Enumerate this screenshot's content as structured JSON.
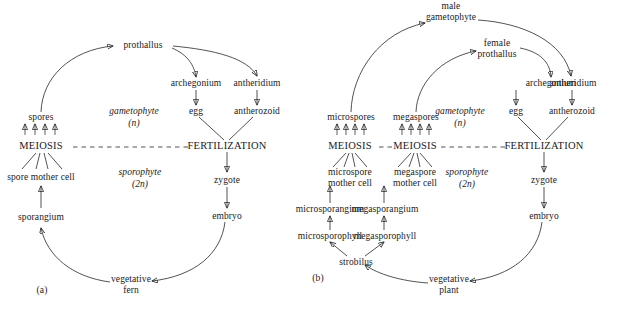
{
  "figure": {
    "type": "diagram",
    "panels": [
      {
        "id": "a",
        "caption": "(a)",
        "organism": "fern",
        "phase_labels": [
          {
            "name": "gametophyte-phase-label",
            "text": "gametophyte",
            "ploidy": "(n)"
          },
          {
            "name": "sporophyte-phase-label",
            "text": "sporophyte",
            "ploidy": "(2n)"
          }
        ],
        "process_labels": [
          "MEIOSIS",
          "FERTILIZATION"
        ],
        "nodes": [
          {
            "id": "a-prothallus",
            "text": "prothallus"
          },
          {
            "id": "a-archegonium",
            "text": "archegonium"
          },
          {
            "id": "a-antheridium",
            "text": "antheridium"
          },
          {
            "id": "a-egg",
            "text": "egg"
          },
          {
            "id": "a-antherozoid",
            "text": "antherozoid"
          },
          {
            "id": "a-spores",
            "text": "spores"
          },
          {
            "id": "a-meiosis",
            "text": "MEIOSIS"
          },
          {
            "id": "a-fertilization",
            "text": "FERTILIZATION"
          },
          {
            "id": "a-spore-mother-cell",
            "text": "spore mother cell"
          },
          {
            "id": "a-zygote",
            "text": "zygote"
          },
          {
            "id": "a-sporangium",
            "text": "sporangium"
          },
          {
            "id": "a-embryo",
            "text": "embryo"
          },
          {
            "id": "a-vegetative-fern",
            "text": "vegetative\nfern"
          }
        ]
      },
      {
        "id": "b",
        "caption": "(b)",
        "organism": "heterosporous plant",
        "phase_labels": [
          {
            "name": "gametophyte-phase-label",
            "text": "gametophyte",
            "ploidy": "(n)"
          },
          {
            "name": "sporophyte-phase-label",
            "text": "sporophyte",
            "ploidy": "(2n)"
          }
        ],
        "process_labels": [
          "MEIOSIS",
          "MEIOSIS",
          "FERTILIZATION"
        ],
        "nodes": [
          {
            "id": "b-male-gametophyte",
            "text": "male\ngametophyte"
          },
          {
            "id": "b-female-prothallus",
            "text": "female\nprothallus"
          },
          {
            "id": "b-archegonium",
            "text": "archegonium"
          },
          {
            "id": "b-antheridium",
            "text": "antheridium"
          },
          {
            "id": "b-egg",
            "text": "egg"
          },
          {
            "id": "b-antherozoid",
            "text": "antherozoid"
          },
          {
            "id": "b-microspores",
            "text": "microspores"
          },
          {
            "id": "b-megaspores",
            "text": "megaspores"
          },
          {
            "id": "b-meiosis-1",
            "text": "MEIOSIS"
          },
          {
            "id": "b-meiosis-2",
            "text": "MEIOSIS"
          },
          {
            "id": "b-fertilization",
            "text": "FERTILIZATION"
          },
          {
            "id": "b-microspore-mother-cell",
            "text": "microspore\nmother cell"
          },
          {
            "id": "b-megaspore-mother-cell",
            "text": "megaspore\nmother cell"
          },
          {
            "id": "b-zygote",
            "text": "zygote"
          },
          {
            "id": "b-microsporangium",
            "text": "microsporangium"
          },
          {
            "id": "b-megasporangium",
            "text": "megasporangium"
          },
          {
            "id": "b-embryo",
            "text": "embryo"
          },
          {
            "id": "b-microsporophyll",
            "text": "microsporophyll"
          },
          {
            "id": "b-megasporophyll",
            "text": "megasporophyll"
          },
          {
            "id": "b-strobilus",
            "text": "strobilus"
          },
          {
            "id": "b-vegetative-plant",
            "text": "vegetative\nplant"
          }
        ]
      }
    ],
    "colors": {
      "ink": "#1a1a1a",
      "background": "#ffffff"
    }
  }
}
